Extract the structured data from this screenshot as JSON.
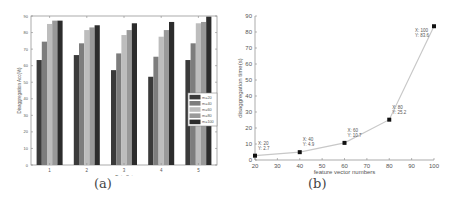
{
  "chart_data": [
    {
      "type": "bar",
      "panel": "(a)",
      "title": "",
      "xlabel": "Data Set",
      "ylabel": "Disaggregation Acc(%)",
      "categories": [
        "1",
        "2",
        "3",
        "4",
        "5"
      ],
      "ylim": [
        0,
        90
      ],
      "yticks": [
        0,
        10,
        20,
        30,
        40,
        50,
        60,
        70,
        80,
        90
      ],
      "grid": false,
      "legend_position": "right-center inside",
      "series": [
        {
          "name": "m=20",
          "color": "#3a3a3a",
          "values": [
            63.4,
            66.4,
            57.3,
            53.3,
            63.4
          ]
        },
        {
          "name": "m=40",
          "color": "#7d7d7d",
          "values": [
            74.5,
            73.5,
            67.4,
            65.4,
            73.5
          ]
        },
        {
          "name": "m=60",
          "color": "#bdbdbd",
          "values": [
            85.2,
            81.5,
            78.5,
            77.5,
            85.6
          ]
        },
        {
          "name": "m=80",
          "color": "#999999",
          "values": [
            87.2,
            83.1,
            81.5,
            81.5,
            86.4
          ]
        },
        {
          "name": "m=100",
          "color": "#2c2c2c",
          "values": [
            87.2,
            84.4,
            85.6,
            86.4,
            89.6
          ]
        }
      ]
    },
    {
      "type": "line",
      "panel": "(b)",
      "title": "",
      "xlabel": "feature vector numbers",
      "ylabel": "disaggregation time(s)",
      "x": [
        20,
        40,
        60,
        80,
        100
      ],
      "series": [
        {
          "name": "time",
          "color": "#c8c8c8",
          "values": [
            2.7,
            4.9,
            10.7,
            25.2,
            83.6
          ]
        }
      ],
      "annotations": [
        {
          "x_label": "X: 20",
          "y_label": "Y: 2.7"
        },
        {
          "x_label": "X: 40",
          "y_label": "Y: 4.9"
        },
        {
          "x_label": "X: 60",
          "y_label": "Y: 10.7"
        },
        {
          "x_label": "X: 80",
          "y_label": "Y: 25.2"
        },
        {
          "x_label": "X: 100",
          "y_label": "Y: 83.6"
        }
      ],
      "xlim": [
        20,
        100
      ],
      "ylim": [
        0,
        90
      ],
      "xticks": [
        20,
        30,
        40,
        50,
        60,
        70,
        80,
        90,
        100
      ],
      "yticks": [
        0,
        10,
        20,
        30,
        40,
        50,
        60,
        70,
        80,
        90
      ],
      "grid": false
    }
  ],
  "captions": {
    "a": "(a)",
    "b": "(b)"
  }
}
